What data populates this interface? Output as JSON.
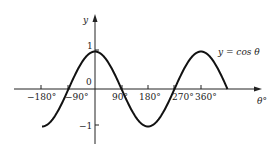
{
  "chart_data": {
    "type": "line",
    "title": "",
    "xlabel": "θ°",
    "ylabel": "y",
    "series": [
      {
        "name": "y = cos θ",
        "function": "cos",
        "x_range_deg": [
          -180,
          450
        ],
        "x": [
          -180,
          -90,
          0,
          90,
          180,
          270,
          360,
          450
        ],
        "values": [
          -1,
          0,
          1,
          0,
          -1,
          0,
          1,
          0
        ]
      }
    ],
    "x_ticks": [
      "−180°",
      "−90°",
      "90°",
      "180°",
      "270°",
      "360°"
    ],
    "x_tick_values": [
      -180,
      -90,
      90,
      180,
      270,
      360
    ],
    "y_ticks": [
      "1",
      "0",
      "−1"
    ],
    "y_tick_values": [
      1,
      0,
      -1
    ],
    "annotations": [
      "y = cos θ"
    ],
    "ylim": [
      -1.5,
      1.8
    ],
    "xlim": [
      -200,
      500
    ],
    "grid": false,
    "legend": "none"
  },
  "labels": {
    "y_axis": "y",
    "x_axis": "θ°",
    "curve": "y = cos θ",
    "origin": "0",
    "y_one": "1",
    "y_neg_one": "−1",
    "x_m180": "−180°",
    "x_m90": "−90°",
    "x_90": "90°",
    "x_180": "180°",
    "x_270": "270°",
    "x_360": "360°"
  }
}
